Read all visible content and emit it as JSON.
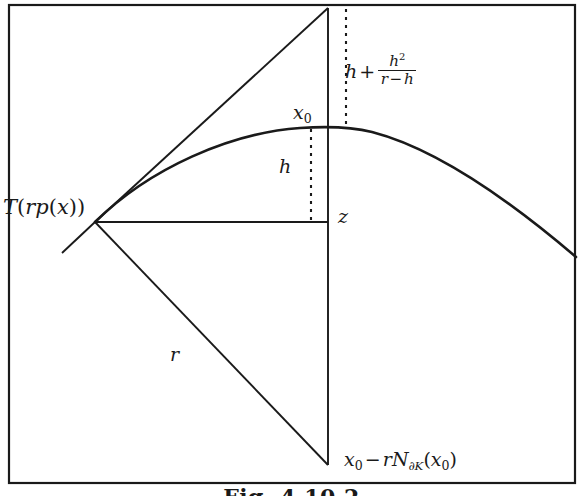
{
  "figure": {
    "caption": "Fig. 4.10.2",
    "border_color": "#1a1a1a",
    "ink_color": "#1a1a1a",
    "background": "#ffffff",
    "width": 583,
    "height": 496
  },
  "labels": {
    "tangent_space": {
      "text": "T(rp(x))",
      "parts": {
        "T": "T",
        "open1": "(",
        "r": "r",
        "p": "p",
        "open2": "(",
        "x": "x",
        "close2": ")",
        "close1": ")"
      }
    },
    "height_formula": {
      "text": "h + h^2/(r-h)",
      "parts": {
        "h": "h",
        "plus": "+",
        "numerator": "h",
        "numerator_exp": "2",
        "den_r": "r",
        "den_minus": "−",
        "den_h": "h"
      }
    },
    "x0_upper": {
      "text": "x0",
      "base": "x",
      "subscript": "0"
    },
    "h_segment": {
      "text": "h"
    },
    "z_point": {
      "text": "z"
    },
    "r_radius": {
      "text": "r"
    },
    "x0_lower": {
      "text": "x0 - rN∂K(x0)",
      "parts": {
        "x": "x",
        "x_sub": "0",
        "minus": "−",
        "r": "r",
        "N": "N",
        "N_sub_partial": "∂",
        "N_sub_K": "K",
        "open": "(",
        "x2": "x",
        "x2_sub": "0",
        "close": ")"
      }
    }
  },
  "geometry": {
    "vertex_tangent_point": {
      "x": 95,
      "y": 222
    },
    "vertex_top": {
      "x": 328,
      "y": 8
    },
    "vertex_bottom": {
      "x": 328,
      "y": 465
    },
    "curve_apex": {
      "x": 355,
      "y": 127
    },
    "curve_start": {
      "x": 95,
      "y": 222
    },
    "curve_end": {
      "x": 576,
      "y": 257
    },
    "horizontal_line_end": {
      "x": 328,
      "y": 222
    },
    "dotted_upper": {
      "x": 346,
      "y_from": 8,
      "y_to": 126
    },
    "dotted_lower": {
      "x": 311,
      "y_from": 128,
      "y_to": 222
    },
    "tangent_stub_end": {
      "x": 62,
      "y": 253
    }
  }
}
